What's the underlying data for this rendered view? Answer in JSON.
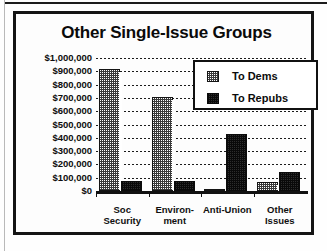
{
  "chart_data": {
    "type": "bar",
    "title": "Other Single-Issue Groups",
    "xlabel": "",
    "ylabel": "",
    "ylim": [
      0,
      1000000
    ],
    "grid": true,
    "legend_position": "top-right",
    "categories": [
      "Soc Security",
      "Environ- ment",
      "Anti-Union",
      "Other Issues"
    ],
    "category_lines": [
      [
        "Soc",
        "Security"
      ],
      [
        "Environ-",
        "ment"
      ],
      [
        "Anti-Union",
        ""
      ],
      [
        "Other",
        "Issues"
      ]
    ],
    "series": [
      {
        "name": "To Dems",
        "values": [
          920000,
          710000,
          10000,
          70000
        ]
      },
      {
        "name": "To Repubs",
        "values": [
          75000,
          75000,
          430000,
          140000
        ]
      }
    ],
    "ytick_labels": [
      "$1,000,000",
      "$900,000",
      "$800,000",
      "$700,000",
      "$600,000",
      "$500,000",
      "$400,000",
      "$300,000",
      "$200,000",
      "$100,000",
      "$0"
    ],
    "ytick_values": [
      1000000,
      900000,
      800000,
      700000,
      600000,
      500000,
      400000,
      300000,
      200000,
      100000,
      0
    ]
  },
  "legend": {
    "items": [
      {
        "label": "To Dems",
        "swatch": "light-checker"
      },
      {
        "label": "To Repubs",
        "swatch": "dark-checker"
      }
    ]
  },
  "colors": {
    "ink": "#111111",
    "dem_fill": "#ffffff",
    "dem_dither": "#3a3a3a",
    "rep_fill": "#2d2d2d",
    "rep_dither": "#0a0a0a",
    "page_bg": "#ffffff"
  }
}
